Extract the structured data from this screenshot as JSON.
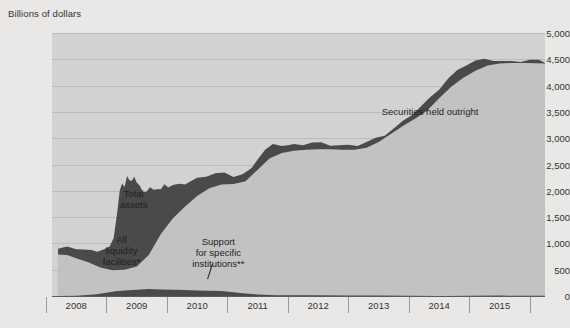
{
  "chart_data": {
    "type": "area",
    "title": "",
    "subtitle": "",
    "xlabel": "",
    "ylabel": "Billions of dollars",
    "ylim": [
      0,
      5000
    ],
    "xlim": [
      2007.6,
      2015.75
    ],
    "grid": true,
    "legend_position": "inline-annotations",
    "yticks": [
      "0",
      "500",
      "1,000",
      "1,500",
      "2,000",
      "2,500",
      "3,000",
      "3,500",
      "4,000",
      "4,500",
      "5,000"
    ],
    "ytick_values": [
      0,
      500,
      1000,
      1500,
      2000,
      2500,
      3000,
      3500,
      4000,
      4500,
      5000
    ],
    "xticks": [
      "2008",
      "2009",
      "2010",
      "2011",
      "2012",
      "2013",
      "2014",
      "2015"
    ],
    "xtick_values": [
      2008,
      2009,
      2010,
      2011,
      2012,
      2013,
      2014,
      2015
    ],
    "annotations": [
      {
        "id": "total-assets",
        "text": "Total\nassets",
        "x": 2008.95,
        "y": 1850
      },
      {
        "id": "all-liquidity-facilities",
        "text": "All\nliquidity\nfacilities*",
        "x": 2008.75,
        "y": 880
      },
      {
        "id": "support-specific-institutions",
        "text": "Support\nfor specific\ninstitutions**",
        "x": 2010.35,
        "y": 830
      },
      {
        "id": "securities-held-outright",
        "text": "Securities held outright",
        "x": 2013.85,
        "y": 3520
      }
    ],
    "series": [
      {
        "name": "Total assets",
        "color": "#4a4a4a",
        "x": [
          2007.7,
          2007.85,
          2008.0,
          2008.12,
          2008.25,
          2008.35,
          2008.45,
          2008.55,
          2008.62,
          2008.68,
          2008.72,
          2008.76,
          2008.8,
          2008.84,
          2008.88,
          2008.92,
          2008.96,
          2009.0,
          2009.05,
          2009.1,
          2009.16,
          2009.22,
          2009.28,
          2009.34,
          2009.4,
          2009.46,
          2009.52,
          2009.6,
          2009.7,
          2009.8,
          2009.9,
          2010.0,
          2010.15,
          2010.3,
          2010.45,
          2010.6,
          2010.75,
          2010.9,
          2011.0,
          2011.12,
          2011.25,
          2011.4,
          2011.5,
          2011.6,
          2011.75,
          2011.9,
          2012.05,
          2012.2,
          2012.35,
          2012.5,
          2012.65,
          2012.8,
          2012.95,
          2013.1,
          2013.25,
          2013.4,
          2013.55,
          2013.7,
          2013.85,
          2014.0,
          2014.15,
          2014.3,
          2014.45,
          2014.6,
          2014.75,
          2014.9,
          2015.05,
          2015.2,
          2015.35,
          2015.5,
          2015.65,
          2015.75
        ],
        "y": [
          900,
          905,
          890,
          880,
          875,
          880,
          885,
          900,
          1100,
          1600,
          2000,
          2180,
          2080,
          2250,
          2200,
          2180,
          2260,
          2200,
          2110,
          1950,
          1980,
          2050,
          2010,
          2070,
          2040,
          2100,
          2060,
          2090,
          2120,
          2160,
          2200,
          2230,
          2270,
          2310,
          2330,
          2300,
          2330,
          2420,
          2600,
          2750,
          2870,
          2890,
          2880,
          2880,
          2870,
          2890,
          2900,
          2890,
          2880,
          2870,
          2860,
          2900,
          2980,
          3080,
          3200,
          3330,
          3450,
          3580,
          3750,
          3950,
          4150,
          4300,
          4400,
          4450,
          4480,
          4490,
          4480,
          4470,
          4470,
          4465,
          4460,
          4455
        ]
      },
      {
        "name": "Securities held outright",
        "color": "#c2c2c2",
        "x": [
          2007.7,
          2007.85,
          2008.0,
          2008.2,
          2008.4,
          2008.6,
          2008.8,
          2009.0,
          2009.2,
          2009.4,
          2009.6,
          2009.8,
          2010.0,
          2010.2,
          2010.4,
          2010.6,
          2010.8,
          2011.0,
          2011.2,
          2011.4,
          2011.6,
          2011.8,
          2012.0,
          2012.2,
          2012.4,
          2012.6,
          2012.8,
          2013.0,
          2013.2,
          2013.4,
          2013.6,
          2013.8,
          2014.0,
          2014.2,
          2014.4,
          2014.6,
          2014.8,
          2015.0,
          2015.2,
          2015.4,
          2015.6,
          2015.75
        ],
        "y": [
          790,
          780,
          720,
          640,
          540,
          490,
          500,
          560,
          780,
          1180,
          1480,
          1700,
          1900,
          2050,
          2120,
          2130,
          2180,
          2400,
          2620,
          2720,
          2760,
          2780,
          2790,
          2790,
          2780,
          2780,
          2820,
          2930,
          3080,
          3230,
          3370,
          3520,
          3760,
          3980,
          4150,
          4280,
          4380,
          4420,
          4430,
          4430,
          4425,
          4420
        ]
      },
      {
        "name": "Support for specific institutions",
        "color": "#4a4a4a",
        "x": [
          2007.7,
          2008.0,
          2008.3,
          2008.5,
          2008.65,
          2008.8,
          2009.0,
          2009.2,
          2009.4,
          2009.6,
          2009.8,
          2010.0,
          2010.2,
          2010.4,
          2010.6,
          2010.8,
          2011.0,
          2011.3,
          2011.6,
          2012.0,
          2012.5,
          2013.0,
          2013.5,
          2014.0,
          2014.5,
          2015.0,
          2015.75
        ],
        "y": [
          0,
          0,
          30,
          60,
          90,
          110,
          120,
          130,
          125,
          120,
          115,
          110,
          100,
          90,
          70,
          45,
          30,
          20,
          15,
          10,
          8,
          6,
          5,
          5,
          4,
          4,
          4
        ]
      }
    ]
  }
}
